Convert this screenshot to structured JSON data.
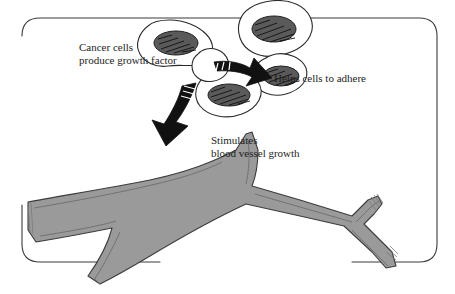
{
  "diagram": {
    "frame": {
      "name": "rounded-border-frame",
      "stroke": "#3a3a3a"
    },
    "labels": {
      "cancer_cells": "Cancer cells\nproduce growth factor",
      "adhere": "Helps cells to adhere",
      "stimulates": "Stimulates\nblood vessel growth"
    },
    "colors": {
      "ink": "#1d1d1d",
      "outline": "#2b2b2b",
      "vessel_fill": "#9a9a9a",
      "vessel_stroke": "#3c3c3c",
      "cell_fill": "#ffffff",
      "nucleus_fill": "#4a4a4a",
      "arrow_fill": "#111111",
      "background": "#ffffff"
    },
    "elements": {
      "cell_cluster": "cancer-cell-cluster",
      "cells_count": 5,
      "arrow_down": "growth-factor-arrow-down",
      "arrow_right": "adhesion-arrow-right",
      "blood_vessel": "blood-vessel",
      "vessel_branches": 2
    }
  }
}
